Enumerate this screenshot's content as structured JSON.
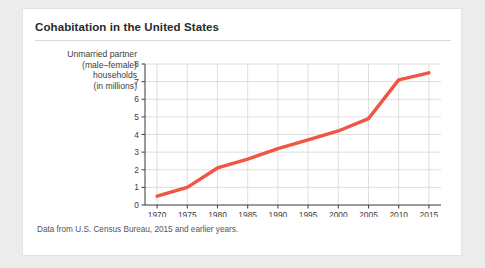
{
  "figure": {
    "title": "Cohabitation in the United States",
    "caption": "Data from U.S. Census Bureau, 2015 and earlier years.",
    "y_axis_title_lines": [
      "Unmarried partner",
      "(male–female)",
      "households",
      "(in millions)"
    ],
    "line_color": "#ef5644",
    "grid_color": "#d6d6d6",
    "axis_color": "#4a4a4a"
  },
  "chart_data": {
    "type": "line",
    "title": "Cohabitation in the United States",
    "xlabel": "Year",
    "ylabel": "Unmarried partner (male–female) households (in millions)",
    "x": [
      1970,
      1975,
      1980,
      1985,
      1990,
      1995,
      2000,
      2005,
      2010,
      2015
    ],
    "values": [
      0.5,
      1.0,
      2.1,
      2.6,
      3.2,
      3.7,
      4.2,
      4.9,
      7.1,
      7.5
    ],
    "xlim": [
      1968,
      2017
    ],
    "ylim": [
      0,
      8
    ],
    "xticks": [
      1970,
      1975,
      1980,
      1985,
      1990,
      1995,
      2000,
      2005,
      2010,
      2015
    ],
    "yticks": [
      0,
      1,
      2,
      3,
      4,
      5,
      6,
      7,
      8
    ],
    "xtick_labels": [
      "1970",
      "1975",
      "1980",
      "1985",
      "1990",
      "1995",
      "2000",
      "2005",
      "2010",
      "2015"
    ],
    "ytick_labels": [
      "0",
      "1",
      "2",
      "3",
      "4",
      "5",
      "6",
      "7",
      "8"
    ],
    "grid": true,
    "legend": false,
    "series": [
      {
        "name": "Unmarried partner households",
        "values": [
          0.5,
          1.0,
          2.1,
          2.6,
          3.2,
          3.7,
          4.2,
          4.9,
          7.1,
          7.5
        ]
      }
    ]
  }
}
